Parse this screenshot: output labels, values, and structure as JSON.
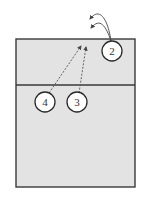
{
  "diagram": {
    "type": "volleyball-court-play",
    "colors": {
      "court_fill": "#e3e3e3",
      "court_stroke": "#3a3a3a",
      "line": "#555555",
      "circle_fill": "#ffffff"
    },
    "players": [
      {
        "id": "p2",
        "label": "2",
        "cx": 112,
        "cy": 51
      },
      {
        "id": "p4",
        "label": "4",
        "cx": 45,
        "cy": 102
      },
      {
        "id": "p3",
        "label": "3",
        "cx": 77,
        "cy": 102
      }
    ],
    "dashed_paths": [
      {
        "from": "4",
        "to": "net-near-center"
      },
      {
        "from": "3",
        "to": "net-near-center"
      }
    ],
    "curved_paths": [
      {
        "from": "2",
        "label": "arc-upper"
      },
      {
        "from": "2",
        "label": "arc-lower"
      }
    ]
  }
}
